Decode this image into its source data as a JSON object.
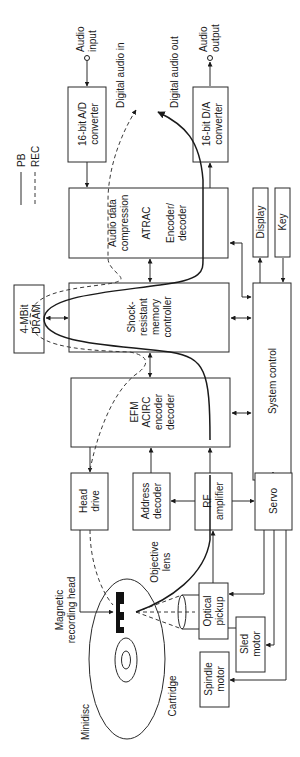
{
  "legend": {
    "pb": "PB",
    "rec": "REC"
  },
  "external": {
    "audio_input": [
      "Audio",
      "input"
    ],
    "audio_output": [
      "Audio",
      "output"
    ],
    "digital_audio_in": "Digital audio in",
    "digital_audio_out": "Digital audio out",
    "objective_lens": [
      "Objective",
      "lens"
    ],
    "magnetic_head": [
      "Magnetic",
      "recording head"
    ],
    "minidisc": "Minidisc",
    "cartridge": "Cartridge"
  },
  "blocks": {
    "ad": [
      "16-bit A/D",
      "converter"
    ],
    "da": [
      "16-bit D/A",
      "converter"
    ],
    "atrac": [
      "Audio data",
      "compression",
      "ATRAC",
      "Encoder/",
      "decoder"
    ],
    "display": "Display",
    "key": "Key",
    "dram": [
      "4-MBit",
      "DRAM"
    ],
    "memctl": [
      "Shock-",
      "resistant",
      "memory",
      "controller"
    ],
    "sysctl": "System control",
    "efm": [
      "EFM",
      "ACIRC",
      "encoder",
      "decoder"
    ],
    "headdrive": [
      "Head",
      "drive"
    ],
    "addrdec": [
      "Address",
      "decoder"
    ],
    "rfamp": [
      "RF",
      "amplifier"
    ],
    "servo": "Servo",
    "pickup": [
      "Optical",
      "pickup"
    ],
    "sled": [
      "Sled",
      "motor"
    ],
    "spindle": [
      "Spindle",
      "motor"
    ]
  }
}
